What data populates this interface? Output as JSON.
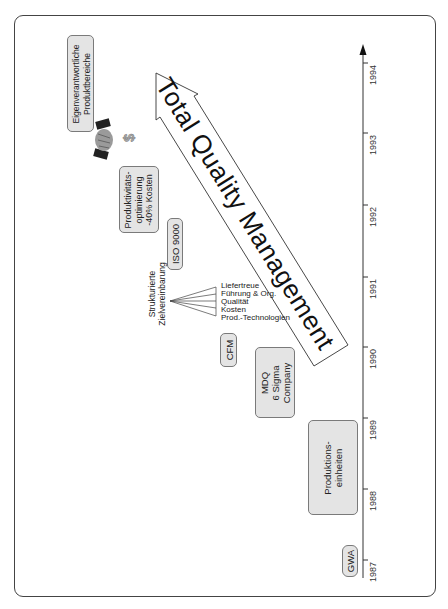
{
  "timeline": {
    "years": [
      "1987",
      "1988",
      "1989",
      "1990",
      "1991",
      "1992",
      "1993",
      "1994"
    ]
  },
  "milestones": {
    "gwa": {
      "lines": [
        "GWA"
      ]
    },
    "produktionseinheiten": {
      "lines": [
        "Produktions-",
        "einheiten"
      ]
    },
    "mdq": {
      "lines": [
        "MDQ",
        "6 Sigma",
        "Company"
      ]
    },
    "cfm": {
      "lines": [
        "CFM"
      ]
    },
    "iso": {
      "lines": [
        "ISO 9000"
      ]
    },
    "produktivitaet": {
      "lines": [
        "Produktivitäts-",
        "optimierung",
        "-40% Kosten"
      ]
    },
    "eigenverantwortlich": {
      "lines": [
        "Eigenverantwortliche",
        "Produktbereiche"
      ]
    }
  },
  "zielvereinbarung": {
    "label_lines": [
      "Strukturierte",
      "Zielvereinbarung"
    ],
    "items": [
      "Liefertreue",
      "Führung & Org.",
      "Qualität",
      "Kosten",
      "Prod.-Technologien"
    ]
  },
  "arrow": {
    "label": "Total Quality Management"
  },
  "icons": {
    "handshake": "handshake-icon",
    "dollar": "dollar-icon"
  }
}
